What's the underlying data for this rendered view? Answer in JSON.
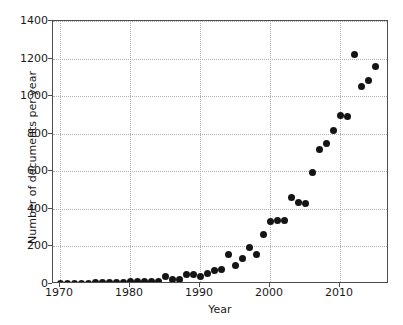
{
  "chart_data": {
    "type": "scatter",
    "title": "",
    "xlabel": "Year",
    "ylabel": "Number of documents per year",
    "xlim": [
      1969,
      2017
    ],
    "ylim": [
      0,
      1400
    ],
    "xticks": [
      1970,
      1980,
      1990,
      2000,
      2010
    ],
    "yticks": [
      0,
      200,
      400,
      600,
      800,
      1000,
      1200,
      1400
    ],
    "grid": true,
    "legend": "none",
    "marker": {
      "shape": "circle",
      "color": "#141414",
      "size": 7
    },
    "series": [
      {
        "name": "Documents per year",
        "x": [
          1970,
          1971,
          1972,
          1973,
          1974,
          1975,
          1976,
          1977,
          1978,
          1979,
          1980,
          1981,
          1982,
          1983,
          1984,
          1985,
          1986,
          1987,
          1988,
          1989,
          1990,
          1991,
          1992,
          1993,
          1994,
          1995,
          1996,
          1997,
          1998,
          1999,
          2000,
          2001,
          2002,
          2003,
          2004,
          2005,
          2006,
          2007,
          2008,
          2009,
          2010,
          2011,
          2012,
          2013,
          2014,
          2015
        ],
        "values": [
          3,
          4,
          4,
          5,
          5,
          6,
          6,
          7,
          8,
          9,
          12,
          11,
          12,
          12,
          13,
          38,
          22,
          26,
          52,
          50,
          41,
          55,
          70,
          75,
          158,
          100,
          135,
          195,
          157,
          263,
          335,
          340,
          338,
          458,
          432,
          428,
          595,
          715,
          748,
          815,
          895,
          893,
          1222,
          1050,
          1083,
          1160
        ]
      }
    ]
  },
  "axis": {
    "x_title": "Year",
    "y_title": "Number of documents per year",
    "x_tick_labels": [
      "1970",
      "1980",
      "1990",
      "2000",
      "2010"
    ],
    "y_tick_labels": [
      "0",
      "200",
      "400",
      "600",
      "800",
      "1000",
      "1200",
      "1400"
    ]
  },
  "style": {
    "marker_color": "#141414",
    "axis_color": "#4d4d4d",
    "grid_color": "#b0b0b0",
    "background": "#ffffff"
  }
}
